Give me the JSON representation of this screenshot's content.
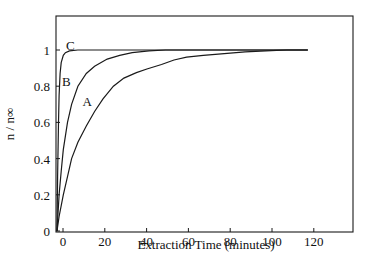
{
  "chart_data": {
    "type": "line",
    "title": "",
    "xlabel": "Extraction Time (minutes)",
    "ylabel": "n / n∞",
    "xlim": [
      -2,
      140
    ],
    "ylim": [
      0,
      1.16
    ],
    "x_ticks": [
      0,
      20,
      40,
      60,
      80,
      100,
      120
    ],
    "y_ticks": [
      0,
      0.2,
      0.4,
      0.6,
      0.8,
      1
    ],
    "y_tick_labels": [
      "0",
      "0.2",
      "0.4",
      "0.6",
      "0.8",
      "1"
    ],
    "x_tick_labels": [
      "0",
      "20",
      "40",
      "60",
      "80",
      "100",
      "120"
    ],
    "grid": false,
    "legend": "none (curves labeled inline)",
    "series": [
      {
        "name": "A",
        "x": [
          0,
          1,
          3,
          5,
          7,
          10,
          14,
          18,
          22,
          27,
          32,
          38,
          43,
          50,
          56,
          62,
          70,
          80,
          90,
          100,
          110,
          120
        ],
        "y": [
          0,
          0.08,
          0.2,
          0.3,
          0.4,
          0.49,
          0.58,
          0.66,
          0.73,
          0.8,
          0.845,
          0.875,
          0.895,
          0.92,
          0.945,
          0.96,
          0.97,
          0.98,
          0.99,
          0.995,
          1.0,
          1.0
        ]
      },
      {
        "name": "B",
        "x": [
          0,
          1,
          2,
          3,
          5,
          7,
          10,
          14,
          18,
          24,
          30,
          36,
          44,
          52,
          60,
          80,
          100,
          120
        ],
        "y": [
          0,
          0.2,
          0.33,
          0.45,
          0.6,
          0.7,
          0.8,
          0.87,
          0.91,
          0.95,
          0.97,
          0.985,
          0.995,
          1.0,
          1.0,
          1.0,
          1.0,
          1.0
        ]
      },
      {
        "name": "C",
        "x": [
          0,
          0.3,
          0.7,
          1,
          1.5,
          2,
          3,
          4,
          6,
          10,
          20,
          40,
          60,
          80,
          100,
          120
        ],
        "y": [
          0,
          0.3,
          0.6,
          0.75,
          0.87,
          0.93,
          0.97,
          0.985,
          0.995,
          1.0,
          1.0,
          1.0,
          1.0,
          1.0,
          1.0,
          1.0
        ]
      }
    ],
    "annotations": [
      {
        "text": "A",
        "x": 13,
        "y": 0.72
      },
      {
        "text": "B",
        "x": 3,
        "y": 0.83
      },
      {
        "text": "C",
        "x": 5,
        "y": 1.03
      }
    ]
  },
  "axes": {
    "xlabel": "Extraction Time (minutes)",
    "ylabel": "n / n∞"
  },
  "colors": {
    "line": "#1a1a1a",
    "background": "#ffffff"
  }
}
